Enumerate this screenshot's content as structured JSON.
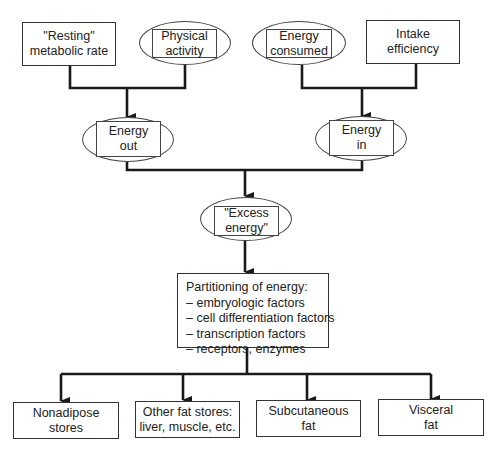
{
  "diagram": {
    "type": "flowchart",
    "top_inputs": [
      {
        "id": "resting",
        "shape": "rectangle",
        "lines": [
          "\"Resting\"",
          "metabolic rate"
        ]
      },
      {
        "id": "physical",
        "shape": "oval-with-box",
        "lines": [
          "Physical",
          "activity"
        ]
      },
      {
        "id": "consumed",
        "shape": "oval-with-box",
        "lines": [
          "Energy",
          "consumed"
        ]
      },
      {
        "id": "intake",
        "shape": "rectangle",
        "lines": [
          "Intake",
          "efficiency"
        ]
      }
    ],
    "middle": [
      {
        "id": "energy_out",
        "shape": "oval-with-box",
        "lines": [
          "Energy",
          "out"
        ]
      },
      {
        "id": "energy_in",
        "shape": "oval-with-box",
        "lines": [
          "Energy",
          "in"
        ]
      }
    ],
    "excess": {
      "id": "excess",
      "shape": "oval-with-box",
      "lines": [
        "\"Excess",
        "energy\""
      ]
    },
    "partitioning": {
      "title": "Partitioning of energy:",
      "items": [
        "– embryologic factors",
        "– cell differentiation factors",
        "– transcription factors",
        "– receptors, enzymes"
      ]
    },
    "outputs": [
      {
        "id": "nonadipose",
        "lines": [
          "Nonadipose",
          "stores"
        ]
      },
      {
        "id": "other_fat",
        "lines": [
          "Other fat stores:",
          "liver, muscle, etc."
        ]
      },
      {
        "id": "subcutaneous",
        "lines": [
          "Subcutaneous",
          "fat"
        ]
      },
      {
        "id": "visceral",
        "lines": [
          "Visceral",
          "fat"
        ]
      }
    ],
    "edges": [
      [
        "resting",
        "energy_out"
      ],
      [
        "physical",
        "energy_out"
      ],
      [
        "consumed",
        "energy_in"
      ],
      [
        "intake",
        "energy_in"
      ],
      [
        "energy_out",
        "excess"
      ],
      [
        "energy_in",
        "excess"
      ],
      [
        "excess",
        "partitioning"
      ],
      [
        "partitioning",
        "nonadipose"
      ],
      [
        "partitioning",
        "other_fat"
      ],
      [
        "partitioning",
        "subcutaneous"
      ],
      [
        "partitioning",
        "visceral"
      ]
    ],
    "colors": {
      "line": "#1a1a1a",
      "border": "#333333",
      "background": "#ffffff"
    }
  }
}
